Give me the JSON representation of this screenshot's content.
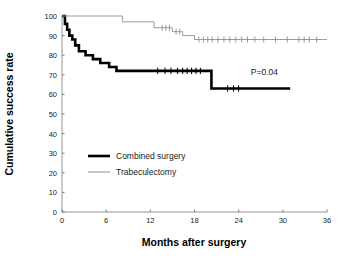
{
  "chart_data": {
    "type": "line",
    "title": "",
    "xlabel": "Months after surgery",
    "ylabel": "Cumulative success rate",
    "xlim": [
      0,
      36
    ],
    "ylim": [
      0,
      100
    ],
    "xticks": [
      0,
      6,
      12,
      18,
      24,
      30,
      36
    ],
    "xtick_labels": [
      "0",
      "6",
      "12",
      "18",
      "24",
      "30",
      "36"
    ],
    "yticks": [
      0,
      10,
      20,
      30,
      40,
      50,
      60,
      70,
      80,
      90,
      100
    ],
    "ytick_labels": [
      "0",
      "10",
      "20",
      "30",
      "40",
      "50",
      "60",
      "70",
      "80",
      "90",
      "100"
    ],
    "grid": false,
    "legend_position": "center-left",
    "annotations": [
      {
        "name": "p-value",
        "text": "P=0.04",
        "x": 27.5,
        "y": 70
      }
    ],
    "series": [
      {
        "name": "Combined surgery",
        "style": "step-post",
        "color": "#000000",
        "line_width": 2.6,
        "points": [
          {
            "x": 0.0,
            "y": 100
          },
          {
            "x": 0.4,
            "y": 96
          },
          {
            "x": 0.7,
            "y": 93
          },
          {
            "x": 1.0,
            "y": 90
          },
          {
            "x": 1.4,
            "y": 88
          },
          {
            "x": 1.8,
            "y": 85
          },
          {
            "x": 2.3,
            "y": 82
          },
          {
            "x": 3.2,
            "y": 80
          },
          {
            "x": 4.2,
            "y": 78
          },
          {
            "x": 5.2,
            "y": 76
          },
          {
            "x": 6.4,
            "y": 74
          },
          {
            "x": 7.4,
            "y": 72
          },
          {
            "x": 20.3,
            "y": 63
          },
          {
            "x": 31.0,
            "y": 63
          }
        ],
        "censored": [
          {
            "x": 13.0,
            "y": 72
          },
          {
            "x": 14.0,
            "y": 72
          },
          {
            "x": 14.8,
            "y": 72
          },
          {
            "x": 15.7,
            "y": 72
          },
          {
            "x": 16.4,
            "y": 72
          },
          {
            "x": 17.0,
            "y": 72
          },
          {
            "x": 17.6,
            "y": 72
          },
          {
            "x": 18.2,
            "y": 72
          },
          {
            "x": 18.8,
            "y": 72
          },
          {
            "x": 22.5,
            "y": 63
          },
          {
            "x": 23.3,
            "y": 63
          },
          {
            "x": 24.0,
            "y": 63
          }
        ]
      },
      {
        "name": "Trabeculectomy",
        "style": "step-post",
        "color": "#9a9a9a",
        "line_width": 1.0,
        "points": [
          {
            "x": 0.0,
            "y": 100
          },
          {
            "x": 8.2,
            "y": 97
          },
          {
            "x": 12.5,
            "y": 94
          },
          {
            "x": 15.0,
            "y": 92
          },
          {
            "x": 16.4,
            "y": 90
          },
          {
            "x": 18.0,
            "y": 88
          },
          {
            "x": 36.0,
            "y": 88
          }
        ],
        "censored": [
          {
            "x": 13.6,
            "y": 94
          },
          {
            "x": 14.1,
            "y": 94
          },
          {
            "x": 14.6,
            "y": 94
          },
          {
            "x": 15.5,
            "y": 92
          },
          {
            "x": 16.0,
            "y": 92
          },
          {
            "x": 18.6,
            "y": 88
          },
          {
            "x": 19.2,
            "y": 88
          },
          {
            "x": 19.8,
            "y": 88
          },
          {
            "x": 20.4,
            "y": 88
          },
          {
            "x": 21.2,
            "y": 88
          },
          {
            "x": 22.0,
            "y": 88
          },
          {
            "x": 22.8,
            "y": 88
          },
          {
            "x": 23.6,
            "y": 88
          },
          {
            "x": 24.4,
            "y": 88
          },
          {
            "x": 25.2,
            "y": 88
          },
          {
            "x": 26.2,
            "y": 88
          },
          {
            "x": 27.4,
            "y": 88
          },
          {
            "x": 29.0,
            "y": 88
          },
          {
            "x": 30.6,
            "y": 88
          },
          {
            "x": 32.2,
            "y": 88
          },
          {
            "x": 32.9,
            "y": 88
          },
          {
            "x": 33.6,
            "y": 88
          },
          {
            "x": 34.6,
            "y": 88
          }
        ]
      }
    ],
    "legend": [
      {
        "label": "Combined surgery",
        "color": "#000000",
        "line_width": 2.6
      },
      {
        "label": "Trabeculectomy",
        "color": "#9a9a9a",
        "line_width": 1.1
      }
    ]
  }
}
